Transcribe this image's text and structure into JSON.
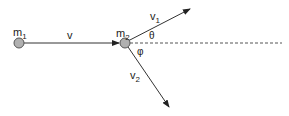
{
  "diagram": {
    "labels": {
      "m1": "m",
      "m1_sub": "1",
      "m2": "m",
      "m2_sub": "2",
      "v": "v",
      "v1": "v",
      "v1_sub": "1",
      "v2": "v",
      "v2_sub": "2",
      "theta": "θ",
      "phi": "φ"
    },
    "colors": {
      "line": "#333333",
      "mass_fill": "#b0b0b0",
      "dash": "#555555"
    }
  }
}
